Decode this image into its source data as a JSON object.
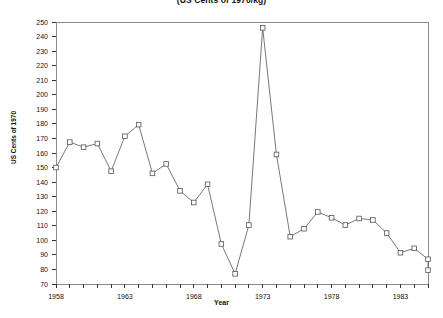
{
  "chart_data": {
    "type": "line",
    "title": "(US Cents of 1970/kg)",
    "xlabel": "Year",
    "ylabel": "US Cents of 1970",
    "xlim": [
      1958,
      1985
    ],
    "ylim": [
      70,
      250
    ],
    "ytick_step": 10,
    "xtick_step": 1,
    "xtick_labels": [
      "1958",
      "1963",
      "1968",
      "1973",
      "1978",
      "1983"
    ],
    "xtick_label_values": [
      1958,
      1963,
      1968,
      1973,
      1978,
      1983
    ],
    "ytick_labels": [
      "70",
      "80",
      "90",
      "100",
      "110",
      "120",
      "130",
      "140",
      "150",
      "160",
      "170",
      "180",
      "190",
      "200",
      "210",
      "220",
      "230",
      "240",
      "250"
    ],
    "grid": false,
    "legend": null,
    "marker": "open-square",
    "line_color": "#555555",
    "marker_color": "#555555",
    "background_color": "#ffffff",
    "x": [
      1958,
      1959,
      1960,
      1961,
      1962,
      1963,
      1964,
      1965,
      1966,
      1967,
      1968,
      1969,
      1970,
      1971,
      1972,
      1973,
      1974,
      1975,
      1976,
      1977,
      1978,
      1979,
      1980,
      1981,
      1982,
      1983,
      1984,
      1985
    ],
    "values": [
      150.0,
      167.5,
      164.0,
      166.5,
      147.5,
      171.5,
      179.5,
      146.0,
      152.5,
      134.0,
      126.0,
      138.5,
      97.5,
      77.0,
      110.5,
      246.0,
      159.0,
      102.5,
      108.0,
      119.5,
      115.5,
      110.5,
      115.0,
      114.0,
      105.0,
      91.5,
      94.5,
      87.0
    ],
    "series": [
      {
        "name": "US Cents of 1970/kg",
        "values": [
          150.0,
          167.5,
          164.0,
          166.5,
          147.5,
          171.5,
          179.5,
          146.0,
          152.5,
          134.0,
          126.0,
          138.5,
          97.5,
          77.0,
          110.5,
          246.0,
          159.0,
          102.5,
          108.0,
          119.5,
          115.5,
          110.5,
          115.0,
          114.0,
          105.0,
          91.5,
          94.5,
          87.0
        ]
      }
    ],
    "last_point_value": 79.5,
    "annotations": []
  }
}
